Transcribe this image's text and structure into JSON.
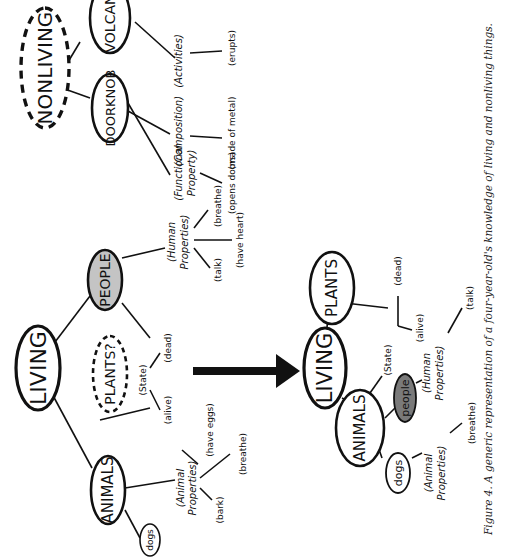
{
  "figure": {
    "caption": "Figure 4. A generic representation of a four-year-old's knowledge of living and nonliving things.",
    "orientation": "rotated 90° counter-clockwise",
    "arrow": "thick arrow pointing from the 'before' living network to the 'after' living network"
  },
  "before_living": {
    "root": "LIVING",
    "children": [
      "ANIMALS",
      "PLANTS?",
      "PEOPLE"
    ],
    "animals_child": "dogs",
    "animal_properties": {
      "category": [
        "(Animal",
        "Properties)"
      ],
      "items": [
        "(bark)",
        "(breathe)",
        "(have eggs)"
      ]
    },
    "state": {
      "category": "(State)",
      "items": [
        "(alive)",
        "(dead)"
      ]
    },
    "human_properties": {
      "category": [
        "(Human",
        "Properties)"
      ],
      "items": [
        "(talk)",
        "(have heart)",
        "(breathe)"
      ]
    }
  },
  "nonliving": {
    "root": "NONLIVING",
    "children": [
      "DOORKNOB",
      "VOLCANO"
    ],
    "functional": {
      "category": [
        "(Functional",
        "Property)"
      ],
      "item": "(opens doors)"
    },
    "composition": {
      "category": "(Composition)",
      "item": "(made of metal)"
    },
    "activities": {
      "category": "(Activities)",
      "item": "(erupts)"
    }
  },
  "after_living": {
    "root": "LIVING",
    "children": [
      "ANIMALS",
      "PLANTS"
    ],
    "animals_children": [
      "dogs",
      "people"
    ],
    "animal_properties": {
      "category": [
        "(Animal",
        "Properties)"
      ],
      "item": "(breathe)"
    },
    "state": {
      "category": "(State)",
      "items": [
        "(alive)",
        "(dead)"
      ]
    },
    "human_properties": {
      "category": [
        "(Human",
        "Properties)"
      ],
      "item": "(talk)"
    }
  },
  "colors": {
    "ink": "#111111",
    "people_before_fill": "#c4c4c4",
    "people_after_fill": "#7a7a7a",
    "background": "#ffffff"
  }
}
